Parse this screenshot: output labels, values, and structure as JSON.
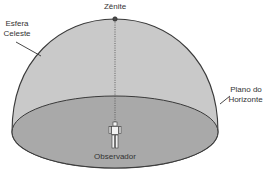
{
  "diagram": {
    "type": "celestial-sphere-illustration",
    "labels": {
      "zenith": "Zênite",
      "sphere_line1": "Esfera",
      "sphere_line2": "Celeste",
      "horizon_line1": "Plano do",
      "horizon_line2": "Horizonte",
      "observer": "Observador"
    },
    "colors": {
      "dome_fill": "#c9c9c9",
      "dome_stroke": "#3a3a3a",
      "horizon_fill": "#a9a9a9",
      "observer_fill": "#f2f2f2",
      "text": "#333333",
      "zenith_point": "#4a4a4a"
    },
    "elements": [
      {
        "id": "celestial-dome",
        "shape": "hemisphere"
      },
      {
        "id": "horizon-plane",
        "shape": "ellipse"
      },
      {
        "id": "zenith-point",
        "shape": "dot"
      },
      {
        "id": "zenith-line",
        "shape": "dotted-vertical-line"
      },
      {
        "id": "observer-figure",
        "shape": "human-figure"
      }
    ]
  }
}
